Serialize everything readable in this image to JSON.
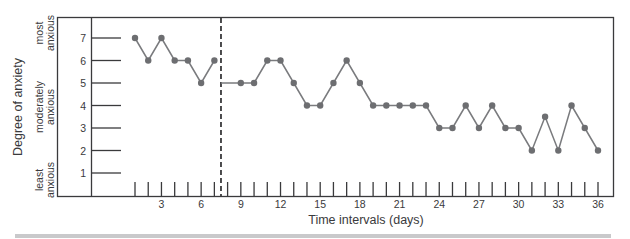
{
  "chart_data": {
    "type": "line",
    "title": "",
    "xlabel": "Time intervals (days)",
    "ylabel": "Degree of anxiety",
    "x_ticks_labeled": [
      3,
      6,
      9,
      12,
      15,
      18,
      21,
      24,
      27,
      30,
      33,
      36
    ],
    "x_range": [
      1,
      36
    ],
    "y_ticks": [
      1,
      2,
      3,
      4,
      5,
      6,
      7
    ],
    "y_range": [
      0,
      7.5
    ],
    "y_annotations": [
      {
        "label": "most anxious",
        "near": 7
      },
      {
        "label": "moderately anxious",
        "near": 4.5
      },
      {
        "label": "least anxious",
        "near": 1
      }
    ],
    "phase_divider": {
      "x": 7.5,
      "style": "dashed"
    },
    "grid": false,
    "legend": null,
    "series": [
      {
        "name": "Phase 1 (baseline)",
        "x": [
          1,
          2,
          3,
          4,
          5,
          6,
          7
        ],
        "values": [
          7,
          6,
          7,
          6,
          6,
          5,
          6
        ]
      },
      {
        "name": "Phase 2 (intervention)",
        "x": [
          9,
          10,
          11,
          12,
          13,
          14,
          15,
          16,
          17,
          18,
          19,
          20,
          21,
          22,
          23,
          24,
          25,
          26,
          27,
          28,
          29,
          30,
          31,
          32,
          33,
          34,
          35,
          36
        ],
        "values": [
          5,
          5,
          6,
          6,
          5,
          4,
          4,
          5,
          6,
          5,
          4,
          4,
          4,
          4,
          4,
          3,
          3,
          4,
          3,
          4,
          3,
          3,
          2,
          3.5,
          2,
          4,
          3,
          2
        ],
        "line_starts_at_divider_value": 5
      }
    ],
    "colors": {
      "frame": "#3a3a3c",
      "series": "#7a7b7e",
      "marker": "#6d6e71",
      "divider": "#3a3a3c",
      "bottom_rule": "#c9c9cb"
    }
  }
}
